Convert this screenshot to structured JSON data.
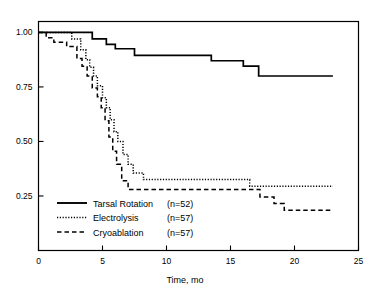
{
  "chart_data": {
    "type": "line",
    "title": "",
    "subtitle": "",
    "xlabel": "Time, mo",
    "ylabel": "",
    "xlim": [
      0,
      25
    ],
    "ylim": [
      0,
      1.05
    ],
    "xticks": [
      0,
      5,
      10,
      15,
      20,
      25
    ],
    "xtick_labels": [
      "0",
      "5",
      "10",
      "15",
      "20",
      "25"
    ],
    "yticks": [
      0.25,
      0.5,
      0.75,
      1.0
    ],
    "ytick_labels": [
      "0.25",
      "0.50",
      "0.75",
      "1.00"
    ],
    "grid": false,
    "legend_position": "lower-left",
    "curve_style": "step-post",
    "series": [
      {
        "name": "Tarsal Rotation",
        "n": 52,
        "legend_label": "Tarsal Rotation",
        "legend_n": "(n=52)",
        "line_style": "solid",
        "color": "#000000",
        "x": [
          0.0,
          4.2,
          4.2,
          5.3,
          5.3,
          6.0,
          6.0,
          7.5,
          7.5,
          13.5,
          13.5,
          16.0,
          16.0,
          17.2,
          17.2,
          23.0
        ],
        "y": [
          1.0,
          1.0,
          0.97,
          0.97,
          0.945,
          0.945,
          0.925,
          0.925,
          0.895,
          0.895,
          0.87,
          0.87,
          0.845,
          0.845,
          0.8,
          0.8
        ]
      },
      {
        "name": "Electrolysis",
        "n": 57,
        "legend_label": "Electrolysis",
        "legend_n": "(n=57)",
        "line_style": "dotted",
        "color": "#000000",
        "x": [
          0.0,
          2.6,
          2.6,
          3.3,
          3.3,
          3.7,
          3.7,
          4.0,
          4.0,
          4.3,
          4.3,
          4.6,
          4.6,
          5.0,
          5.0,
          5.3,
          5.3,
          5.6,
          5.6,
          5.9,
          5.9,
          6.2,
          6.2,
          6.6,
          6.6,
          7.0,
          7.0,
          7.4,
          7.4,
          8.2,
          8.2,
          16.5,
          16.5,
          23.0
        ],
        "y": [
          1.0,
          1.0,
          0.97,
          0.97,
          0.92,
          0.92,
          0.875,
          0.875,
          0.84,
          0.84,
          0.8,
          0.8,
          0.755,
          0.755,
          0.7,
          0.7,
          0.655,
          0.655,
          0.6,
          0.6,
          0.545,
          0.545,
          0.5,
          0.5,
          0.44,
          0.44,
          0.395,
          0.395,
          0.355,
          0.355,
          0.325,
          0.325,
          0.295,
          0.295
        ]
      },
      {
        "name": "Cryoablation",
        "n": 57,
        "legend_label": "Cryoablation",
        "legend_n": "(n=57)",
        "line_style": "dashed",
        "color": "#000000",
        "x": [
          0.0,
          0.6,
          0.6,
          1.2,
          1.2,
          2.2,
          2.2,
          3.0,
          3.0,
          3.4,
          3.4,
          3.8,
          3.8,
          4.2,
          4.2,
          4.6,
          4.6,
          4.9,
          4.9,
          5.2,
          5.2,
          5.5,
          5.5,
          5.8,
          5.8,
          6.1,
          6.1,
          6.5,
          6.5,
          7.0,
          7.0,
          17.3,
          17.3,
          18.4,
          18.4,
          19.2,
          19.2,
          23.0
        ],
        "y": [
          1.0,
          1.0,
          0.975,
          0.975,
          0.955,
          0.955,
          0.935,
          0.935,
          0.88,
          0.88,
          0.845,
          0.845,
          0.8,
          0.8,
          0.745,
          0.745,
          0.705,
          0.705,
          0.655,
          0.655,
          0.595,
          0.595,
          0.52,
          0.52,
          0.455,
          0.455,
          0.395,
          0.395,
          0.32,
          0.32,
          0.28,
          0.28,
          0.245,
          0.245,
          0.215,
          0.215,
          0.185,
          0.185
        ]
      }
    ]
  }
}
